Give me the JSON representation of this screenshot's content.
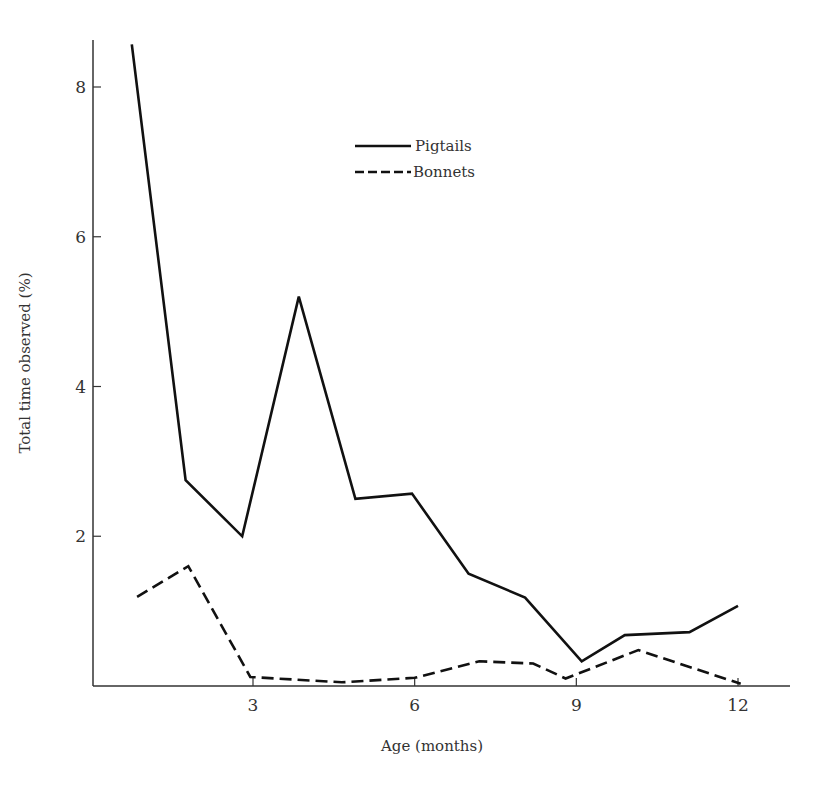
{
  "chart_data": {
    "type": "line",
    "title": "",
    "xlabel": "Age (months)",
    "ylabel": "Total time observed (%)",
    "xlim": [
      0,
      13
    ],
    "ylim": [
      0,
      8.6
    ],
    "x_ticks": [
      3,
      6,
      9,
      12
    ],
    "y_ticks": [
      2,
      4,
      6,
      8
    ],
    "grid": false,
    "legend_position": "upper center",
    "series": [
      {
        "name": "Pigtails",
        "style": "solid",
        "x": [
          0.75,
          1.75,
          2.8,
          3.85,
          4.9,
          5.95,
          7.0,
          8.05,
          9.1,
          9.9,
          11.1,
          12.0
        ],
        "values": [
          8.57,
          2.75,
          2.0,
          5.2,
          2.5,
          2.57,
          1.5,
          1.18,
          0.33,
          0.68,
          0.72,
          1.07
        ]
      },
      {
        "name": "Bonnets",
        "style": "dashed",
        "x": [
          0.85,
          1.8,
          2.95,
          4.65,
          6.0,
          7.2,
          8.2,
          8.8,
          10.15,
          12.05
        ],
        "values": [
          1.19,
          1.6,
          0.12,
          0.05,
          0.11,
          0.33,
          0.3,
          0.1,
          0.48,
          0.03
        ]
      }
    ]
  },
  "axes": {
    "x_title": "Age (months)",
    "y_title": "Total time observed (%)",
    "x_tick_labels": [
      "3",
      "6",
      "9",
      "12"
    ],
    "y_tick_labels": [
      "2",
      "4",
      "6",
      "8"
    ]
  },
  "legend": {
    "items": [
      {
        "label": "Pigtails",
        "style": "solid"
      },
      {
        "label": "Bonnets",
        "style": "dashed"
      }
    ]
  },
  "colors": {
    "line": "#111111",
    "axis": "#333333",
    "background": "#ffffff"
  }
}
